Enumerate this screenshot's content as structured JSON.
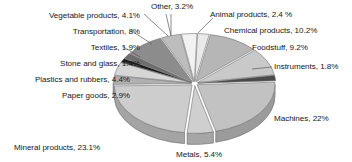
{
  "chart_data": {
    "type": "pie",
    "title": "",
    "subtitle": "",
    "xlabel": "",
    "ylabel": "",
    "legend_position": "none",
    "grid": false,
    "style": "3d-pie-grayscale",
    "value_unit": "percent",
    "categories": [
      "Animal products",
      "Chemical products",
      "Foodstuff",
      "Instruments",
      "Machines",
      "Metals",
      "Mineral products",
      "Paper goods",
      "Plastics and rubbers",
      "Stone and glass",
      "Textiles",
      "Transportation",
      "Vegetable products",
      "Other"
    ],
    "values": [
      2.4,
      10.2,
      9.2,
      1.8,
      22,
      5.4,
      23.1,
      2.9,
      4.4,
      1.4,
      1.9,
      8,
      4.1,
      3.2
    ],
    "slices": [
      {
        "name": "Animal products",
        "value": 2.4,
        "label": "Animal products, 2.4 %",
        "color": "#e9e9e9"
      },
      {
        "name": "Chemical products",
        "value": 10.2,
        "label": "Chemical products, 10.2%",
        "color": "#b6b6b6"
      },
      {
        "name": "Foodstuff",
        "value": 9.2,
        "label": "Foodstuff, 9.2%",
        "color": "#c9c9c9"
      },
      {
        "name": "Instruments",
        "value": 1.8,
        "label": "Instruments, 1.8%",
        "color": "#4a4a4a"
      },
      {
        "name": "Machines",
        "value": 22,
        "label": "Machines, 22%",
        "color": "#c2c2c2"
      },
      {
        "name": "Metals",
        "value": 5.4,
        "label": "Metals, 5.4%",
        "color": "#cfcfcf"
      },
      {
        "name": "Mineral products",
        "value": 23.1,
        "label": "Mineral products, 23.1%",
        "color": "#cdcdcd"
      },
      {
        "name": "Paper goods",
        "value": 2.9,
        "label": "Paper goods, 2.9%",
        "color": "#b0b0b0"
      },
      {
        "name": "Plastics and rubbers",
        "value": 4.4,
        "label": "Plastics and rubbers, 4.4%",
        "color": "#d6d6d6"
      },
      {
        "name": "Stone and glass",
        "value": 1.4,
        "label": "Stone and glass, 1.4%",
        "color": "#1d1d1d"
      },
      {
        "name": "Textiles",
        "value": 1.9,
        "label": "Textiles, 1.9%",
        "color": "#6e6e6e"
      },
      {
        "name": "Transportation",
        "value": 8,
        "label": "Transportation, 8%",
        "color": "#8c8c8c"
      },
      {
        "name": "Vegetable products",
        "value": 4.1,
        "label": "Vegetable products, 4.1%",
        "color": "#bdbdbd"
      },
      {
        "name": "Other",
        "value": 3.2,
        "label": "Other, 3.2%",
        "color": "#f2f2f2"
      }
    ]
  },
  "labels": {
    "vegetable_products": "Vegetable products, 4.1%",
    "transportation": "Transportation, 8%",
    "textiles": "Textiles, 1.9%",
    "stone_and_glass": "Stone and glass, 1.4%",
    "plastics_and_rubbers": "Plastics and rubbers, 4.4%",
    "paper_goods": "Paper goods, 2.9%",
    "mineral_products": "Mineral products, 23.1%",
    "metals": "Metals, 5.4%",
    "machines": "Machines, 22%",
    "instruments": "Instruments, 1.8%",
    "foodstuff": "Foodstuff, 9.2%",
    "chemical_products": "Chemical products, 10.2%",
    "animal_products": "Animal products, 2.4 %",
    "other": "Other, 3.2%"
  }
}
